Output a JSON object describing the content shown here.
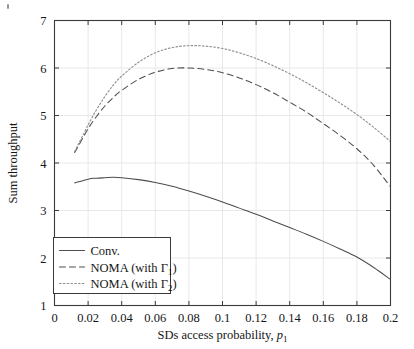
{
  "chart_data": {
    "type": "line",
    "title": "",
    "xlabel": "SDs access probability, p₁",
    "ylabel": "Sum throughput",
    "xlim": [
      0,
      0.2
    ],
    "ylim": [
      1,
      7
    ],
    "xticks": [
      "0",
      "0.02",
      "0.04",
      "0.06",
      "0.08",
      "0.1",
      "0.12",
      "0.14",
      "0.16",
      "0.18",
      "0.2"
    ],
    "xtick_values": [
      0,
      0.02,
      0.04,
      0.06,
      0.08,
      0.1,
      0.12,
      0.14,
      0.16,
      0.18,
      0.2
    ],
    "yticks": [
      "1",
      "2",
      "3",
      "4",
      "5",
      "6",
      "7"
    ],
    "ytick_values": [
      1,
      2,
      3,
      4,
      5,
      6,
      7
    ],
    "grid": true,
    "legend_position": "lower left",
    "x": [
      0.012,
      0.02,
      0.025,
      0.03,
      0.035,
      0.04,
      0.05,
      0.06,
      0.07,
      0.08,
      0.09,
      0.1,
      0.11,
      0.12,
      0.13,
      0.14,
      0.15,
      0.16,
      0.17,
      0.18,
      0.19,
      0.2
    ],
    "series": [
      {
        "name": "Conv.",
        "style": "solid",
        "color": "#4d4d4d",
        "values": [
          3.58,
          3.66,
          3.68,
          3.69,
          3.7,
          3.69,
          3.65,
          3.59,
          3.51,
          3.41,
          3.3,
          3.18,
          3.05,
          2.92,
          2.78,
          2.64,
          2.5,
          2.35,
          2.19,
          2.02,
          1.8,
          1.55
        ]
      },
      {
        "name": "NOMA (with Γ1)",
        "style": "dashed",
        "color": "#4d4d4d",
        "values": [
          4.22,
          4.72,
          4.98,
          5.2,
          5.38,
          5.53,
          5.76,
          5.91,
          5.99,
          6.0,
          5.97,
          5.9,
          5.79,
          5.65,
          5.48,
          5.28,
          5.07,
          4.83,
          4.58,
          4.3,
          3.95,
          3.5
        ]
      },
      {
        "name": "NOMA (with Γ2)",
        "style": "dotted",
        "color": "#8f8f8f",
        "values": [
          4.24,
          4.8,
          5.12,
          5.4,
          5.64,
          5.83,
          6.12,
          6.32,
          6.43,
          6.47,
          6.46,
          6.41,
          6.32,
          6.2,
          6.05,
          5.88,
          5.69,
          5.48,
          5.26,
          5.02,
          4.75,
          4.45
        ]
      }
    ]
  },
  "legend": {
    "items": [
      {
        "label": "Conv.",
        "style": "solid"
      },
      {
        "label": "NOMA (with Γ",
        "sub": "1",
        "tail": ")",
        "style": "dashed"
      },
      {
        "label": "NOMA (with Γ",
        "sub": "2",
        "tail": ")",
        "style": "dotted"
      }
    ]
  },
  "axis_labels": {
    "x_main": "SDs access probability, ",
    "x_var": "p",
    "x_sub": "1",
    "y_main": "Sum throughput"
  },
  "colors": {
    "frame": "#3a3a3a",
    "grid": "#e8e8ea",
    "conv": "#4d4d4d",
    "noma1": "#4d4d4d",
    "noma2": "#8f8f8f",
    "text": "#161616",
    "background": "#ffffff"
  }
}
